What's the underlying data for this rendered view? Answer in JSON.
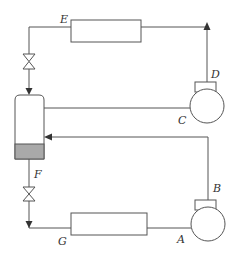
{
  "diagram": {
    "type": "refrigeration-cycle-schematic",
    "colors": {
      "line": "#555555",
      "liquid_fill": "#a9a9a9",
      "background": "#ffffff",
      "label": "#333333"
    },
    "labels": {
      "A": "A",
      "B": "B",
      "C": "C",
      "D": "D",
      "E": "E",
      "F": "F",
      "G": "G"
    },
    "components": [
      {
        "id": "upper-heat-exchanger",
        "kind": "heat-exchanger"
      },
      {
        "id": "lower-heat-exchanger",
        "kind": "heat-exchanger"
      },
      {
        "id": "upper-compressor",
        "kind": "compressor",
        "inlet": "C",
        "outlet": "D"
      },
      {
        "id": "lower-compressor",
        "kind": "compressor",
        "inlet": "A",
        "outlet": "B"
      },
      {
        "id": "upper-expansion-valve",
        "kind": "valve"
      },
      {
        "id": "lower-expansion-valve",
        "kind": "valve"
      },
      {
        "id": "flash-tank",
        "kind": "separator-vessel"
      }
    ]
  }
}
